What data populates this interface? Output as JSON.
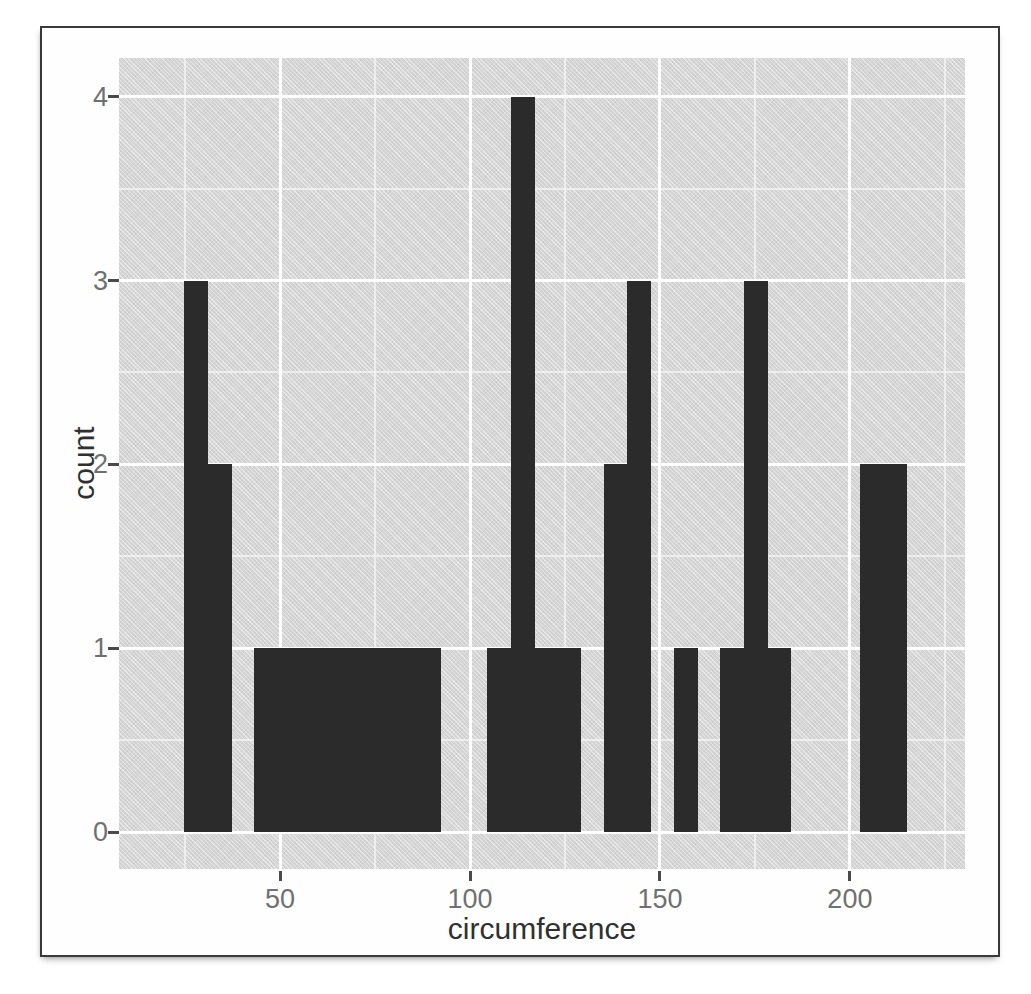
{
  "figure": {
    "xlabel": "circumference",
    "ylabel": "count"
  },
  "colors": {
    "page_bg": "#ffffff",
    "frame_border": "#3a3a3a",
    "panel_bg": "#d5d5d5",
    "grid_major": "#ffffff",
    "grid_minor": "#f2f2f2",
    "bar": "#2b2b2b",
    "tick_mark": "#4a4a4a",
    "tick_label": "#707070",
    "axis_title": "#303030"
  },
  "chart_data": {
    "type": "bar",
    "subtype": "histogram",
    "title": "",
    "xlabel": "circumference",
    "ylabel": "count",
    "x_ticks": [
      50,
      100,
      150,
      200
    ],
    "x_tick_labels": [
      "50",
      "100",
      "150",
      "200"
    ],
    "y_ticks": [
      0,
      1,
      2,
      3,
      4
    ],
    "y_tick_labels": [
      "0",
      "1",
      "2",
      "3",
      "4"
    ],
    "x_minor_gridlines": [
      25,
      75,
      125,
      175,
      225
    ],
    "y_minor_gridlines": [
      0.5,
      1.5,
      2.5,
      3.5
    ],
    "xlim": [
      7.6,
      230.3
    ],
    "ylim": [
      -0.2,
      4.21
    ],
    "grid": "major+minor",
    "legend": "none",
    "binwidth": 6.13,
    "bin_breaks": [
      24.8,
      30.93,
      37.07,
      43.2,
      49.33,
      55.47,
      61.6,
      67.73,
      73.87,
      80.0,
      86.13,
      92.27,
      98.4,
      104.53,
      110.67,
      116.8,
      122.93,
      129.07,
      135.2,
      141.33,
      147.47,
      153.6,
      159.73,
      165.87,
      172.0,
      178.13,
      184.27,
      190.4,
      196.53,
      202.67,
      208.8,
      214.93
    ],
    "bin_counts": [
      3,
      2,
      0,
      1,
      1,
      1,
      1,
      1,
      1,
      1,
      1,
      0,
      0,
      1,
      4,
      1,
      1,
      0,
      2,
      3,
      0,
      1,
      0,
      1,
      3,
      1,
      0,
      0,
      0,
      2,
      2
    ]
  }
}
